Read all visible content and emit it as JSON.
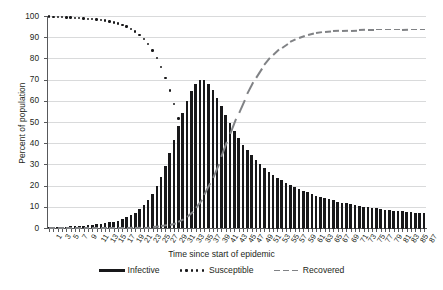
{
  "chart_data": {
    "type": "bar",
    "title": "",
    "xlabel": "Time since start of epidemic",
    "ylabel": "Percent of population",
    "ylim": [
      0,
      100
    ],
    "yticks": [
      0,
      10,
      20,
      30,
      40,
      50,
      60,
      70,
      80,
      90,
      100
    ],
    "grid": true,
    "legend_position": "bottom",
    "x": [
      1,
      2,
      3,
      4,
      5,
      6,
      7,
      8,
      9,
      10,
      11,
      12,
      13,
      14,
      15,
      16,
      17,
      18,
      19,
      20,
      21,
      22,
      23,
      24,
      25,
      26,
      27,
      28,
      29,
      30,
      31,
      32,
      33,
      34,
      35,
      36,
      37,
      38,
      39,
      40,
      41,
      42,
      43,
      44,
      45,
      46,
      47,
      48,
      49,
      50,
      51,
      52,
      53,
      54,
      55,
      56,
      57,
      58,
      59,
      60,
      61,
      62,
      63,
      64,
      65,
      66,
      67,
      68,
      69,
      70,
      71,
      72,
      73,
      74,
      75,
      76,
      77,
      78,
      79,
      80,
      81,
      82,
      83,
      84,
      85,
      86,
      87,
      88
    ],
    "xtick_labels": [
      "1",
      "3",
      "5",
      "7",
      "9",
      "11",
      "13",
      "15",
      "17",
      "19",
      "21",
      "23",
      "25",
      "27",
      "29",
      "31",
      "33",
      "35",
      "37",
      "39",
      "41",
      "43",
      "45",
      "47",
      "49",
      "51",
      "53",
      "55",
      "57",
      "59",
      "61",
      "63",
      "65",
      "67",
      "69",
      "71",
      "73",
      "75",
      "77",
      "79",
      "81",
      "83",
      "85",
      "87"
    ],
    "series": [
      {
        "name": "Infective",
        "style": "bar",
        "color": "#18181a",
        "values": [
          0.3,
          0.4,
          0.5,
          0.6,
          0.7,
          0.8,
          0.9,
          1.0,
          1.1,
          1.3,
          1.5,
          1.7,
          1.9,
          2.2,
          2.6,
          3.0,
          3.5,
          4.2,
          5.0,
          6.0,
          7.3,
          8.9,
          10.8,
          13.2,
          16.2,
          19.8,
          24.2,
          29.3,
          35.2,
          41.6,
          48.1,
          54.4,
          60.0,
          64.6,
          68.0,
          70.0,
          69.8,
          68.0,
          65.1,
          61.4,
          57.4,
          53.3,
          49.4,
          45.7,
          42.3,
          39.3,
          36.6,
          34.2,
          32.0,
          30.0,
          28.2,
          26.6,
          25.1,
          23.8,
          22.5,
          21.4,
          20.3,
          19.3,
          18.4,
          17.6,
          16.8,
          16.0,
          15.3,
          14.7,
          14.1,
          13.5,
          13.0,
          12.5,
          12.0,
          11.6,
          11.2,
          10.8,
          10.4,
          10.1,
          9.8,
          9.5,
          9.2,
          8.9,
          8.7,
          8.5,
          8.2,
          8.0,
          7.8,
          7.6,
          7.5,
          7.3,
          7.1,
          7.0
        ]
      },
      {
        "name": "Susceptible",
        "style": "dotted",
        "color": "#18181a",
        "values": [
          99.7,
          99.6,
          99.5,
          99.4,
          99.3,
          99.2,
          99.1,
          99.0,
          98.9,
          98.7,
          98.5,
          98.3,
          98.0,
          97.8,
          97.4,
          97.0,
          96.5,
          95.8,
          95.0,
          94.0,
          92.7,
          91.1,
          89.2,
          86.8,
          83.8,
          80.2,
          75.8,
          70.7,
          64.8,
          58.4,
          51.6,
          44.6,
          37.8,
          31.4,
          25.6,
          20.6,
          16.4,
          12.9,
          10.1,
          7.8,
          6.0,
          4.6,
          3.6,
          2.7,
          2.1,
          1.6,
          1.2,
          0.9,
          0.7,
          0.6,
          0.4,
          0.3,
          0.3,
          0.2,
          0.2,
          0.1,
          0.1,
          0.1,
          0.1,
          0.1,
          0.1,
          0.0,
          0.0,
          0.0,
          0.0,
          0.0,
          0.0,
          0.0,
          0.0,
          0.0,
          0.0,
          0.0,
          0.0,
          0.0,
          0.0,
          0.0,
          0.0,
          0.0,
          0.0,
          0.0,
          0.0,
          0.0,
          0.0,
          0.0,
          0.0,
          0.0,
          0.0,
          0.0
        ]
      },
      {
        "name": "Recovered",
        "style": "dashed",
        "color": "#808285",
        "values": [
          0.0,
          0.0,
          0.0,
          0.0,
          0.0,
          0.0,
          0.0,
          0.0,
          0.0,
          0.0,
          0.0,
          0.0,
          0.1,
          0.1,
          0.1,
          0.1,
          0.1,
          0.1,
          0.1,
          0.2,
          0.2,
          0.3,
          0.3,
          0.4,
          0.5,
          0.7,
          0.9,
          1.2,
          1.6,
          2.1,
          2.9,
          3.9,
          5.3,
          7.1,
          9.4,
          12.2,
          15.6,
          19.5,
          23.9,
          28.7,
          33.8,
          39.1,
          44.4,
          49.6,
          54.6,
          59.2,
          63.5,
          67.4,
          71.0,
          74.2,
          77.0,
          79.5,
          81.7,
          83.6,
          85.2,
          86.6,
          87.8,
          88.8,
          89.7,
          90.4,
          91.0,
          91.5,
          91.9,
          92.2,
          92.5,
          92.7,
          92.9,
          93.0,
          93.1,
          93.2,
          93.3,
          93.4,
          93.4,
          93.5,
          93.5,
          93.5,
          93.6,
          93.6,
          93.6,
          93.6,
          93.6,
          93.6,
          93.6,
          93.7,
          93.7,
          93.7,
          93.7,
          93.7
        ]
      }
    ]
  },
  "legend": {
    "items": [
      {
        "label": "Infective"
      },
      {
        "label": "Susceptible"
      },
      {
        "label": "Recovered"
      }
    ]
  }
}
